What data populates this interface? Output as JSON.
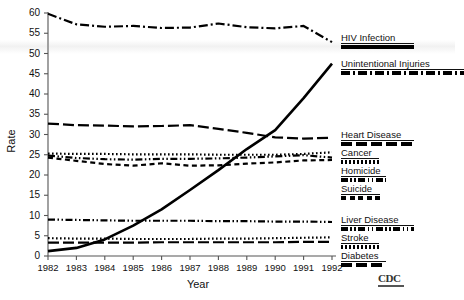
{
  "chart_data": {
    "type": "line",
    "title": "",
    "xlabel": "Year",
    "ylabel": "Rate",
    "xlim": [
      1982,
      1992
    ],
    "ylim": [
      0,
      60
    ],
    "grid": false,
    "legend_position": "right",
    "x": [
      1982,
      1983,
      1984,
      1985,
      1986,
      1987,
      1988,
      1989,
      1990,
      1991,
      1992
    ],
    "xticklabels": [
      "1982",
      "1983",
      "1984",
      "1985",
      "1986",
      "1987",
      "1988",
      "1989",
      "1990",
      "1991",
      "1992"
    ],
    "yticks": [
      0,
      5,
      10,
      15,
      20,
      25,
      30,
      35,
      40,
      45,
      50,
      55,
      60
    ],
    "yticklabels": [
      "0",
      "5",
      "10",
      "15",
      "20",
      "25",
      "30",
      "35",
      "40",
      "45",
      "50",
      "55",
      "60"
    ],
    "series": [
      {
        "name": "Unintentional Injuries",
        "dash": "dashdot",
        "values": [
          59.8,
          57.2,
          56.6,
          56.8,
          56.3,
          56.4,
          57.4,
          56.5,
          56.2,
          56.8,
          52.8
        ]
      },
      {
        "name": "HIV Infection",
        "dash": "solid",
        "values": [
          1.2,
          2.0,
          4.1,
          7.5,
          11.5,
          16.3,
          21.2,
          26.4,
          31.1,
          39.0,
          47.5
        ]
      },
      {
        "name": "Heart Disease",
        "dash": "longdash",
        "values": [
          32.7,
          32.3,
          32.2,
          32.0,
          32.1,
          32.3,
          31.4,
          30.4,
          29.3,
          29.0,
          29.2
        ]
      },
      {
        "name": "Cancer",
        "dash": "dotted",
        "values": [
          25.3,
          25.2,
          25.2,
          25.1,
          25.1,
          25.1,
          25.0,
          25.0,
          25.0,
          25.2,
          25.6
        ]
      },
      {
        "name": "Homicide",
        "dash": "dashdotdot",
        "values": [
          24.8,
          24.2,
          23.9,
          23.8,
          24.0,
          24.0,
          24.1,
          24.3,
          24.6,
          24.9,
          24.3
        ]
      },
      {
        "name": "Suicide",
        "dash": "shortdash",
        "values": [
          24.3,
          23.5,
          22.7,
          22.3,
          22.9,
          22.3,
          22.4,
          22.8,
          23.1,
          23.6,
          23.7
        ]
      },
      {
        "name": "Liver Disease",
        "dash": "dashdotdot",
        "values": [
          9.0,
          8.9,
          8.8,
          8.7,
          8.7,
          8.7,
          8.6,
          8.6,
          8.5,
          8.5,
          8.4
        ]
      },
      {
        "name": "Stroke",
        "dash": "dotted",
        "values": [
          4.4,
          4.3,
          4.3,
          4.2,
          4.2,
          4.2,
          4.3,
          4.3,
          4.4,
          4.5,
          4.6
        ]
      },
      {
        "name": "Diabetes",
        "dash": "longdash",
        "values": [
          3.3,
          3.3,
          3.3,
          3.3,
          3.4,
          3.4,
          3.4,
          3.4,
          3.4,
          3.5,
          3.5
        ]
      }
    ],
    "legend_groups": [
      {
        "entries": [
          {
            "label": "HIV Infection",
            "dash": "solid"
          },
          {
            "label": "Unintentional Injuries",
            "dash": "dashdot"
          }
        ]
      },
      {
        "entries": [
          {
            "label": "Heart Disease",
            "dash": "longdash"
          },
          {
            "label": "Cancer",
            "dash": "dotted"
          },
          {
            "label": "Homicide",
            "dash": "dashdotdot"
          },
          {
            "label": "Suicide",
            "dash": "shortdash"
          }
        ]
      },
      {
        "entries": [
          {
            "label": "Liver Disease",
            "dash": "dashdotdot"
          },
          {
            "label": "Stroke",
            "dash": "dotted"
          },
          {
            "label": "Diabetes",
            "dash": "longdash"
          }
        ]
      }
    ],
    "annotations": [
      {
        "name": "cdc-logo",
        "text": "CDC"
      }
    ],
    "colors": {
      "line": "#000000",
      "axis": "#444444",
      "text": "#111111",
      "background": "#ffffff"
    }
  }
}
